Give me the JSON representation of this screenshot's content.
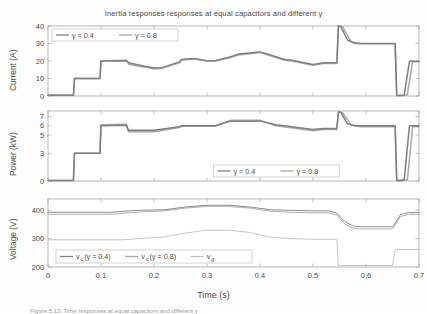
{
  "figure": {
    "title": "Inertia responses responses at equal capacitors and different γ",
    "xlabel": "Time (s)",
    "caption": "Figure 5.13: Time responses at equal capacitors and different γ"
  },
  "colors": {
    "gamma_04": "#7f7f7f",
    "gamma_08": "#a8a8a8",
    "vg": "#c0c0c0",
    "frame": "#9a9a9a",
    "text": "#4a4a4a",
    "background": "#ffffff"
  },
  "chart_data": [
    {
      "type": "line",
      "id": "current-subplot",
      "title": "Inertia responses responses at equal capacitors and different γ",
      "xlabel": "",
      "ylabel": "Current (A)",
      "xlim": [
        0,
        0.7
      ],
      "ylim": [
        0,
        40
      ],
      "xticks": [
        0,
        0.1,
        0.2,
        0.3,
        0.4,
        0.5,
        0.6,
        0.7
      ],
      "yticks": [
        0,
        10,
        20,
        30,
        40
      ],
      "grid": false,
      "legend": {
        "position": "upper-left",
        "entries": [
          {
            "label": "γ = 0.4",
            "color": "#7f7f7f"
          },
          {
            "label": "γ = 0.8",
            "color": "#a8a8a8"
          }
        ]
      },
      "series": [
        {
          "name": "γ = 0.4",
          "x": [
            0,
            0.048,
            0.05,
            0.098,
            0.1,
            0.148,
            0.152,
            0.175,
            0.2,
            0.215,
            0.248,
            0.252,
            0.275,
            0.3,
            0.315,
            0.345,
            0.36,
            0.4,
            0.43,
            0.445,
            0.46,
            0.5,
            0.52,
            0.545,
            0.548,
            0.552,
            0.565,
            0.58,
            0.6,
            0.655,
            0.658,
            0.662,
            0.672,
            0.682,
            0.7
          ],
          "y": [
            0.4,
            0.4,
            10.0,
            10.0,
            20.0,
            20.2,
            19.0,
            17.5,
            16.0,
            16.2,
            19.5,
            20.8,
            21.5,
            20.2,
            20.2,
            22.5,
            24.0,
            25.2,
            22.5,
            21.0,
            20.5,
            18.0,
            19.0,
            19.0,
            40.0,
            40.0,
            32.0,
            30.0,
            30.0,
            30.0,
            0.3,
            0.3,
            0.5,
            19.8,
            19.8
          ]
        },
        {
          "name": "γ = 0.8",
          "x": [
            0,
            0.048,
            0.05,
            0.098,
            0.1,
            0.148,
            0.152,
            0.175,
            0.2,
            0.215,
            0.248,
            0.252,
            0.275,
            0.3,
            0.315,
            0.345,
            0.36,
            0.4,
            0.43,
            0.445,
            0.46,
            0.5,
            0.52,
            0.545,
            0.548,
            0.556,
            0.572,
            0.59,
            0.6,
            0.655,
            0.658,
            0.665,
            0.678,
            0.688,
            0.7
          ],
          "y": [
            0.4,
            0.4,
            10.0,
            10.0,
            20.2,
            20.4,
            18.2,
            16.8,
            15.5,
            15.8,
            19.0,
            20.6,
            21.2,
            20.0,
            20.0,
            22.0,
            23.5,
            24.8,
            22.0,
            20.5,
            20.0,
            17.5,
            18.6,
            18.6,
            40.0,
            39.5,
            31.0,
            29.8,
            29.8,
            29.8,
            0.3,
            0.3,
            0.6,
            19.6,
            19.6
          ]
        }
      ]
    },
    {
      "type": "line",
      "id": "power-subplot",
      "title": "",
      "xlabel": "",
      "ylabel": "Power (kW)",
      "xlim": [
        0,
        0.7
      ],
      "ylim": [
        0,
        7.6
      ],
      "xticks": [
        0,
        0.1,
        0.2,
        0.3,
        0.4,
        0.5,
        0.6,
        0.7
      ],
      "yticks": [
        0,
        3,
        5,
        6,
        7
      ],
      "grid": false,
      "legend": {
        "position": "lower-center",
        "entries": [
          {
            "label": "γ = 0.4",
            "color": "#7f7f7f"
          },
          {
            "label": "γ = 0.8",
            "color": "#a8a8a8"
          }
        ]
      },
      "series": [
        {
          "name": "γ = 0.4",
          "x": [
            0,
            0.048,
            0.05,
            0.098,
            0.1,
            0.148,
            0.152,
            0.2,
            0.248,
            0.252,
            0.3,
            0.315,
            0.345,
            0.4,
            0.43,
            0.445,
            0.5,
            0.52,
            0.545,
            0.548,
            0.552,
            0.565,
            0.58,
            0.6,
            0.655,
            0.658,
            0.662,
            0.672,
            0.682,
            0.7
          ],
          "y": [
            0.05,
            0.05,
            3.0,
            3.0,
            6.0,
            6.05,
            5.5,
            5.5,
            5.9,
            6.0,
            6.0,
            6.0,
            6.5,
            6.5,
            6.1,
            6.0,
            5.6,
            5.7,
            5.7,
            7.5,
            7.5,
            6.2,
            6.0,
            6.0,
            6.0,
            0.05,
            0.05,
            0.1,
            6.0,
            6.0
          ]
        },
        {
          "name": "γ = 0.8",
          "x": [
            0,
            0.048,
            0.05,
            0.098,
            0.1,
            0.148,
            0.152,
            0.2,
            0.248,
            0.252,
            0.3,
            0.315,
            0.345,
            0.4,
            0.43,
            0.445,
            0.5,
            0.52,
            0.545,
            0.548,
            0.556,
            0.572,
            0.59,
            0.6,
            0.655,
            0.658,
            0.665,
            0.678,
            0.688,
            0.7
          ],
          "y": [
            0.05,
            0.05,
            3.0,
            3.0,
            6.1,
            6.15,
            5.35,
            5.35,
            5.8,
            5.95,
            5.95,
            5.95,
            6.6,
            6.6,
            6.0,
            5.9,
            5.45,
            5.6,
            5.6,
            7.5,
            7.4,
            6.1,
            5.9,
            5.9,
            5.9,
            0.05,
            0.05,
            0.12,
            5.9,
            5.9
          ]
        }
      ]
    },
    {
      "type": "line",
      "id": "voltage-subplot",
      "title": "",
      "xlabel": "Time (s)",
      "ylabel": "Voltage (V)",
      "xlim": [
        0,
        0.7
      ],
      "ylim": [
        200,
        440
      ],
      "xticks": [
        0,
        0.1,
        0.2,
        0.3,
        0.4,
        0.5,
        0.6,
        0.7
      ],
      "yticks": [
        200,
        300,
        400
      ],
      "grid": false,
      "legend": {
        "position": "lower-left",
        "entries": [
          {
            "label": "v_c (γ = 0.4)",
            "base": "v",
            "sub": "c",
            "rest": " (γ = 0.4)",
            "color": "#7f7f7f"
          },
          {
            "label": "v_c (γ = 0.8)",
            "base": "v",
            "sub": "c",
            "rest": " (γ = 0.8)",
            "color": "#a8a8a8"
          },
          {
            "label": "v_g",
            "base": "v",
            "sub": "g",
            "rest": "",
            "color": "#c0c0c0"
          }
        ]
      },
      "series": [
        {
          "name": "v_c (γ = 0.4)",
          "x": [
            0,
            0.1,
            0.12,
            0.145,
            0.17,
            0.22,
            0.26,
            0.3,
            0.34,
            0.38,
            0.42,
            0.46,
            0.5,
            0.53,
            0.545,
            0.56,
            0.575,
            0.59,
            0.65,
            0.655,
            0.665,
            0.68,
            0.7
          ],
          "y": [
            393,
            393,
            393,
            397,
            400,
            402,
            412,
            418,
            418,
            412,
            402,
            400,
            398,
            398,
            390,
            360,
            345,
            342,
            342,
            355,
            385,
            392,
            392
          ]
        },
        {
          "name": "v_c (γ = 0.8)",
          "x": [
            0,
            0.1,
            0.12,
            0.145,
            0.17,
            0.22,
            0.26,
            0.3,
            0.34,
            0.38,
            0.42,
            0.46,
            0.5,
            0.53,
            0.545,
            0.56,
            0.575,
            0.59,
            0.65,
            0.655,
            0.665,
            0.68,
            0.7
          ],
          "y": [
            386,
            386,
            386,
            390,
            394,
            398,
            408,
            414,
            414,
            408,
            397,
            393,
            391,
            391,
            383,
            352,
            337,
            334,
            334,
            348,
            378,
            385,
            385
          ]
        },
        {
          "name": "v_g",
          "x": [
            0,
            0.14,
            0.17,
            0.22,
            0.26,
            0.3,
            0.34,
            0.38,
            0.42,
            0.46,
            0.5,
            0.53,
            0.545,
            0.548,
            0.552,
            0.65,
            0.655,
            0.66,
            0.7
          ],
          "y": [
            296,
            296,
            300,
            306,
            320,
            330,
            330,
            322,
            305,
            300,
            298,
            298,
            298,
            205,
            205,
            205,
            258,
            262,
            262
          ]
        }
      ]
    }
  ]
}
